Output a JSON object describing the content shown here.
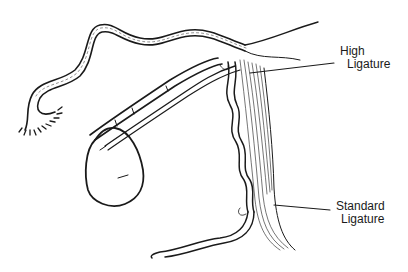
{
  "diagram": {
    "type": "anatomical line illustration",
    "labels": {
      "high_ligature": {
        "line1": "High",
        "line2": "Ligature"
      },
      "standard_ligature": {
        "line1": "Standard",
        "line2": "Ligature"
      }
    },
    "colors": {
      "ink": "#1a1a1a",
      "background": "#ffffff"
    }
  }
}
